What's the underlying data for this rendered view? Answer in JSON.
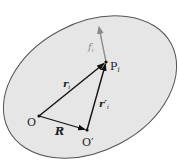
{
  "diagram": {
    "type": "rigid-body-vector-diagram",
    "colors": {
      "body_fill": "#e6e6e6",
      "body_stroke": "#555555",
      "vector": "#111111",
      "force": "#8a8a8a",
      "background": "#ffffff"
    },
    "points": [
      {
        "id": "O",
        "label": "O",
        "x": 39,
        "y": 116
      },
      {
        "id": "O_prime",
        "label": "O′",
        "x": 87,
        "y": 130
      },
      {
        "id": "P_i",
        "label": "P",
        "subscript": "i",
        "x": 106,
        "y": 62
      }
    ],
    "vectors": [
      {
        "id": "R",
        "label": "R",
        "from": "O",
        "to": "O_prime"
      },
      {
        "id": "r_i",
        "label": "r",
        "subscript": "i",
        "from": "O",
        "to": "P_i"
      },
      {
        "id": "r_i_prime",
        "label": "r′",
        "subscript": "i",
        "from": "O_prime",
        "to": "P_i"
      },
      {
        "id": "f_i",
        "label": "f",
        "subscript": "i",
        "from": "P_i",
        "to": "f_tip"
      }
    ],
    "labels": {
      "O": "O",
      "O_prime": "O′",
      "P": "P",
      "P_sub": "i",
      "R": "R",
      "r": "r",
      "r_sub": "i",
      "r_prime": "r′",
      "r_prime_sub": "i",
      "f": "f",
      "f_sub": "i"
    }
  }
}
